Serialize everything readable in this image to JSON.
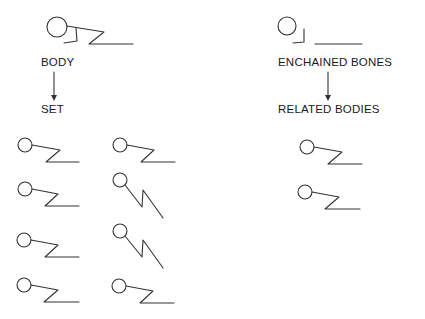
{
  "left_column": {
    "heading": "BODY",
    "subheading": "SET",
    "arrow": "down-arrow"
  },
  "right_column": {
    "heading": "ENCHAINED BONES",
    "subheading": "RELATED BODIES",
    "arrow": "down-arrow"
  },
  "figures": {
    "body": "stick-figure-body",
    "enchained_bones": "separated-bones-figure",
    "set_count": 8,
    "related_bodies_count": 2
  },
  "colors": {
    "line": "#333333",
    "text": "#1a1a1a",
    "background": "#ffffff"
  }
}
